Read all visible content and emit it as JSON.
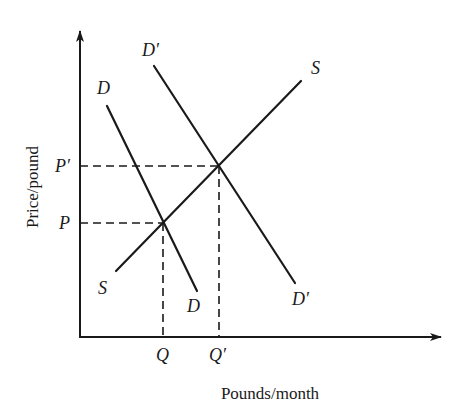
{
  "diagram": {
    "type": "supply-demand",
    "axes": {
      "x_label": "Pounds/month",
      "y_label": "Price/pound"
    },
    "curves": {
      "demand_original": {
        "label_top": "D",
        "label_bottom": "D"
      },
      "demand_shifted": {
        "label_top": "D′",
        "label_bottom": "D′"
      },
      "supply": {
        "label_top": "S",
        "label_bottom": "S"
      }
    },
    "equilibria": {
      "original": {
        "price_label": "P",
        "quantity_label": "Q"
      },
      "shifted": {
        "price_label": "P′",
        "quantity_label": "Q′"
      }
    },
    "colors": {
      "ink": "#1a1a1a",
      "background": "#ffffff"
    }
  }
}
